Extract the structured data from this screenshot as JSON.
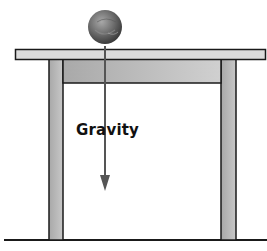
{
  "diagram": {
    "labels": {
      "force": "Gravity"
    },
    "objects": {
      "ball": {
        "name": "ball",
        "cx": 105,
        "cy": 27,
        "r": 17
      },
      "table": {
        "top": {
          "x": 15,
          "y": 49,
          "w": 251,
          "h": 10
        },
        "apron": {
          "x": 63,
          "y": 59,
          "w": 158,
          "h": 24
        },
        "left_leg": {
          "x": 49,
          "y": 59,
          "w": 14,
          "h": 181
        },
        "right_leg": {
          "x": 221,
          "y": 59,
          "w": 15,
          "h": 181
        }
      },
      "floor": {
        "x1": 4,
        "x2": 267,
        "y": 240
      },
      "arrow": {
        "x": 105,
        "y1": 48,
        "y2": 190,
        "direction": "down"
      }
    },
    "colors": {
      "outline": "#1a1a1a",
      "tabletop": "#d9d9d9",
      "leg": "#b5b5b5",
      "apron": "#bdbdbd",
      "arrow": "#555555",
      "ball_dark": "#4a4a4a",
      "ball_light": "#9a9a9a"
    }
  }
}
